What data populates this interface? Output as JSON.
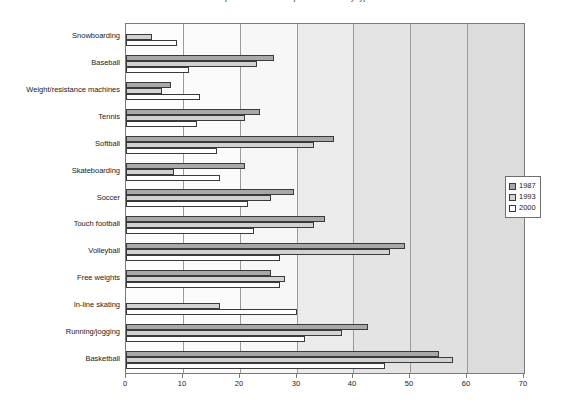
{
  "chart_data": {
    "type": "bar",
    "orientation": "horizontal",
    "title": "Participation in selected sports activities by type",
    "xlabel": "",
    "ylabel": "",
    "xlim": [
      0,
      70
    ],
    "xticks": [
      0,
      10,
      20,
      30,
      40,
      50,
      60,
      70
    ],
    "grid": true,
    "legend_position": "right",
    "categories": [
      "Snowboarding",
      "Baseball",
      "Weight/resistance machines",
      "Tennis",
      "Softball",
      "Skateboarding",
      "Soccer",
      "Touch football",
      "Volleyball",
      "Free weights",
      "In-line skating",
      "Running/jogging",
      "Basketball"
    ],
    "series": [
      {
        "name": "1987",
        "color": "#a8a8a8",
        "values": [
          0,
          26.0,
          8.0,
          23.5,
          36.5,
          21.0,
          29.5,
          35.0,
          49.0,
          25.5,
          0,
          42.5,
          55.0
        ]
      },
      {
        "name": "1993",
        "color": "#d2d2d2",
        "values": [
          4.6,
          23.0,
          6.3,
          21.0,
          33.0,
          8.5,
          25.5,
          33.0,
          46.5,
          28.0,
          16.5,
          38.0,
          57.5
        ]
      },
      {
        "name": "2000",
        "color": "#ffffff",
        "values": [
          9.0,
          11.0,
          13.0,
          12.5,
          16.0,
          16.5,
          21.5,
          22.5,
          27.0,
          27.0,
          30.0,
          31.5,
          45.5
        ]
      }
    ]
  },
  "legend": {
    "entries": [
      {
        "label": "1987"
      },
      {
        "label": "1993"
      },
      {
        "label": "2000"
      }
    ]
  },
  "axis": {
    "x_tick_labels": [
      "0",
      "10",
      "20",
      "30",
      "40",
      "50",
      "60",
      "70"
    ]
  },
  "colors": {
    "series_1987": "#a8a8a8",
    "series_1993": "#d2d2d2",
    "series_2000": "#ffffff",
    "bar_border": "#3a3a3a",
    "plot_border": "#7a7a7a",
    "gridline": "#9a9a9a",
    "text": "#1a1a1a"
  }
}
